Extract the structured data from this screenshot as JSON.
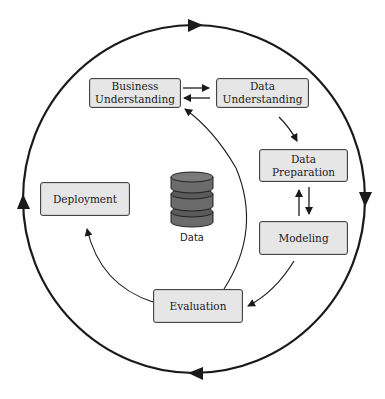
{
  "diagram": {
    "phases": [
      {
        "id": "business",
        "label": "Business Understanding"
      },
      {
        "id": "data_understanding",
        "label": "Data Understanding"
      },
      {
        "id": "data_preparation",
        "label": "Data Preparation"
      },
      {
        "id": "modeling",
        "label": "Modeling"
      },
      {
        "id": "evaluation",
        "label": "Evaluation"
      },
      {
        "id": "deployment",
        "label": "Deployment"
      }
    ],
    "center": {
      "icon": "database-icon",
      "label": "Data"
    },
    "labels": {
      "business_l1": "Business",
      "business_l2": "Understanding",
      "data_und_l1": "Data",
      "data_und_l2": "Understanding",
      "data_prep_l1": "Data",
      "data_prep_l2": "Preparation",
      "modeling": "Modeling",
      "evaluation": "Evaluation",
      "deployment": "Deployment",
      "data": "Data"
    },
    "colors": {
      "box_fill": "#e6e6e6",
      "stroke": "#1a1a1a",
      "db_fill": "#6e6e6e"
    }
  }
}
